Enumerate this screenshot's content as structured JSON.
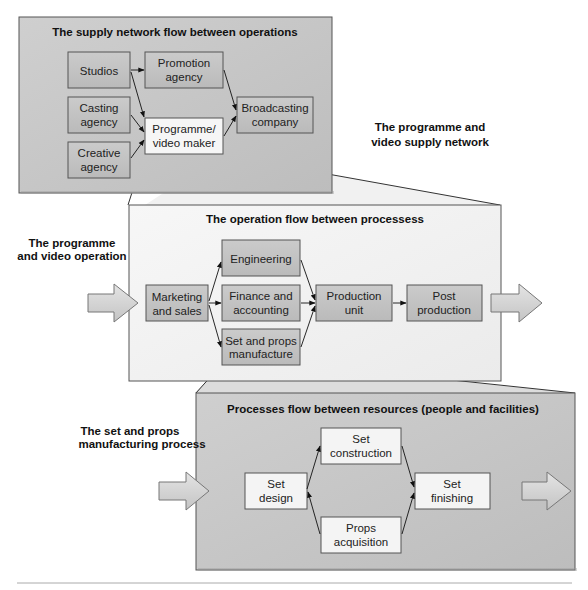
{
  "colors": {
    "panel_dark": "#c7c7c7",
    "panel_light": "#f2f2f2",
    "box_dark": "#c2c2c2",
    "box_light": "#f4f4f4",
    "border": "#555555",
    "arrow_fill": "#d4d4d4"
  },
  "supply_network": {
    "title": "The supply network flow between operations",
    "side_label_line1": "The programme and",
    "side_label_line2": "video supply network",
    "nodes": {
      "studios": "Studios",
      "promotion_1": "Promotion",
      "promotion_2": "agency",
      "casting_1": "Casting",
      "casting_2": "agency",
      "creative_1": "Creative",
      "creative_2": "agency",
      "programme_1": "Programme/",
      "programme_2": "video maker",
      "broadcasting_1": "Broadcasting",
      "broadcasting_2": "company"
    }
  },
  "operation": {
    "title": "The operation flow between processess",
    "side_label_line1": "The programme",
    "side_label_line2": "and video operation",
    "nodes": {
      "marketing_1": "Marketing",
      "marketing_2": "and sales",
      "engineering": "Engineering",
      "finance_1": "Finance and",
      "finance_2": "accounting",
      "setprops_1": "Set and props",
      "setprops_2": "manufacture",
      "production_1": "Production",
      "production_2": "unit",
      "post_1": "Post",
      "post_2": "production"
    }
  },
  "process": {
    "title": "Processes flow between resources (people and facilities)",
    "side_label_line1": "The set and props",
    "side_label_line2": "manufacturing process",
    "nodes": {
      "set_design_1": "Set",
      "set_design_2": "design",
      "construction_1": "Set",
      "construction_2": "construction",
      "props_1": "Props",
      "props_2": "acquisition",
      "finishing_1": "Set",
      "finishing_2": "finishing"
    }
  }
}
